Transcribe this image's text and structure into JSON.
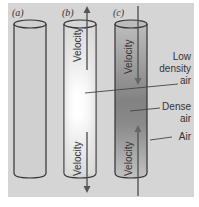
{
  "panels": [
    {
      "id": "a",
      "label": "(a)"
    },
    {
      "id": "b",
      "label": "(b)",
      "top_velocity": "Velocity",
      "bottom_velocity": "Velocity"
    },
    {
      "id": "c",
      "label": "(c)",
      "top_velocity": "Velocity",
      "bottom_velocity": "Velocity"
    }
  ],
  "annotations": {
    "low_density_line1": "Low",
    "low_density_line2": "density",
    "low_density_line3": "air",
    "dense_line1": "Dense",
    "dense_line2": "air",
    "air": "Air"
  },
  "colors": {
    "background": "#d5d5d5",
    "cylinder_plain": "#d0d0d0",
    "low_density_center": "#ffffff",
    "dense_center": "#8a8a8a",
    "stroke": "#333333"
  }
}
